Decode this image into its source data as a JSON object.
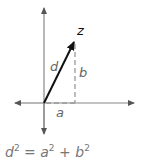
{
  "diagram": {
    "type": "complex-plane-vector",
    "labels": {
      "tip": "z",
      "hypotenuse": "d",
      "vertical": "b",
      "horizontal": "a"
    },
    "formula": {
      "lhs_var": "d",
      "lhs_exp": "2",
      "eq": "=",
      "a_var": "a",
      "a_exp": "2",
      "plus": "+",
      "b_var": "b",
      "b_exp": "2"
    },
    "colors": {
      "axis": "#888888",
      "vector": "#111111",
      "dashed": "#999999",
      "label": "#666666"
    }
  }
}
